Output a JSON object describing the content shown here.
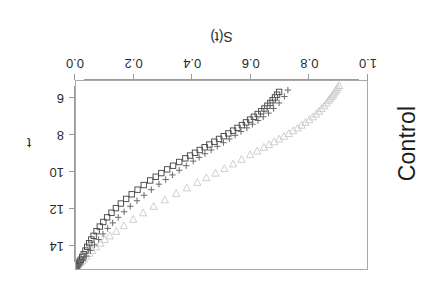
{
  "figure": {
    "title": "Control",
    "rotation_degrees": 180,
    "background": "#ffffff",
    "frame_color": "#a8a8a8"
  },
  "axes": {
    "x": {
      "label": "t",
      "ticks": [
        "6",
        "8",
        "10",
        "12",
        "14"
      ],
      "tick_values": [
        6,
        8,
        10,
        12,
        14
      ],
      "range": [
        5.0,
        15.3
      ]
    },
    "y": {
      "label": "S(t)",
      "ticks": [
        "1.0",
        "0.8",
        "0.6",
        "0.4",
        "0.2",
        "0.0"
      ],
      "tick_values": [
        1.0,
        0.8,
        0.6,
        0.4,
        0.2,
        0.0
      ],
      "range": [
        0.0,
        1.0
      ]
    }
  },
  "legend": {
    "visible": false,
    "entries": [
      {
        "name": "triangle-series",
        "symbol": "triangle-down",
        "color": "#c9c9c9"
      },
      {
        "name": "square-series",
        "symbol": "square-open",
        "color": "#4a4a4a"
      },
      {
        "name": "plus-series",
        "symbol": "plus",
        "color": "#6a6a6a"
      }
    ]
  },
  "chart_data": {
    "type": "scatter",
    "title": "Control",
    "xlabel": "t",
    "ylabel": "S(t)",
    "xlim": [
      5.0,
      15.3
    ],
    "ylim": [
      0.0,
      1.0
    ],
    "grid": false,
    "legend_position": "none",
    "series": [
      {
        "name": "triangle-down",
        "marker": "triangle-down",
        "color": "#c9c9c9",
        "points": [
          [
            5.35,
            0.905
          ],
          [
            5.45,
            0.9
          ],
          [
            5.55,
            0.896
          ],
          [
            5.65,
            0.892
          ],
          [
            5.75,
            0.888
          ],
          [
            5.85,
            0.884
          ],
          [
            5.95,
            0.879
          ],
          [
            6.05,
            0.874
          ],
          [
            6.15,
            0.869
          ],
          [
            6.3,
            0.862
          ],
          [
            6.45,
            0.854
          ],
          [
            6.6,
            0.845
          ],
          [
            6.75,
            0.836
          ],
          [
            6.9,
            0.826
          ],
          [
            7.05,
            0.815
          ],
          [
            7.2,
            0.803
          ],
          [
            7.35,
            0.79
          ],
          [
            7.5,
            0.777
          ],
          [
            7.65,
            0.763
          ],
          [
            7.8,
            0.748
          ],
          [
            7.95,
            0.733
          ],
          [
            8.1,
            0.717
          ],
          [
            8.25,
            0.7
          ],
          [
            8.4,
            0.683
          ],
          [
            8.55,
            0.666
          ],
          [
            8.7,
            0.648
          ],
          [
            8.9,
            0.625
          ],
          [
            9.1,
            0.601
          ],
          [
            9.35,
            0.572
          ],
          [
            9.6,
            0.543
          ],
          [
            9.85,
            0.513
          ],
          [
            10.1,
            0.483
          ],
          [
            10.35,
            0.452
          ],
          [
            10.6,
            0.421
          ],
          [
            10.9,
            0.385
          ],
          [
            11.2,
            0.349
          ],
          [
            11.55,
            0.31
          ],
          [
            11.9,
            0.272
          ],
          [
            12.25,
            0.236
          ],
          [
            12.6,
            0.202
          ],
          [
            12.95,
            0.17
          ],
          [
            13.25,
            0.144
          ],
          [
            13.5,
            0.122
          ],
          [
            13.7,
            0.105
          ],
          [
            13.9,
            0.09
          ],
          [
            14.1,
            0.075
          ],
          [
            14.3,
            0.062
          ],
          [
            14.45,
            0.052
          ],
          [
            14.6,
            0.043
          ],
          [
            14.75,
            0.034
          ],
          [
            14.85,
            0.028
          ],
          [
            14.95,
            0.022
          ],
          [
            15.05,
            0.016
          ],
          [
            15.12,
            0.011
          ],
          [
            15.18,
            0.007
          ]
        ]
      },
      {
        "name": "square-open",
        "marker": "square-open",
        "color": "#4a4a4a",
        "points": [
          [
            5.7,
            0.7
          ],
          [
            5.85,
            0.693
          ],
          [
            6.0,
            0.686
          ],
          [
            6.15,
            0.678
          ],
          [
            6.3,
            0.67
          ],
          [
            6.45,
            0.66
          ],
          [
            6.6,
            0.65
          ],
          [
            6.75,
            0.639
          ],
          [
            6.9,
            0.627
          ],
          [
            7.05,
            0.614
          ],
          [
            7.2,
            0.601
          ],
          [
            7.35,
            0.587
          ],
          [
            7.5,
            0.573
          ],
          [
            7.65,
            0.558
          ],
          [
            7.8,
            0.543
          ],
          [
            7.95,
            0.527
          ],
          [
            8.1,
            0.511
          ],
          [
            8.25,
            0.495
          ],
          [
            8.4,
            0.479
          ],
          [
            8.55,
            0.462
          ],
          [
            8.7,
            0.446
          ],
          [
            8.85,
            0.429
          ],
          [
            9.0,
            0.413
          ],
          [
            9.15,
            0.396
          ],
          [
            9.3,
            0.38
          ],
          [
            9.5,
            0.359
          ],
          [
            9.7,
            0.338
          ],
          [
            9.9,
            0.318
          ],
          [
            10.1,
            0.298
          ],
          [
            10.3,
            0.279
          ],
          [
            10.5,
            0.26
          ],
          [
            10.75,
            0.238
          ],
          [
            11.0,
            0.217
          ],
          [
            11.25,
            0.197
          ],
          [
            11.5,
            0.178
          ],
          [
            11.75,
            0.16
          ],
          [
            12.0,
            0.143
          ],
          [
            12.25,
            0.128
          ],
          [
            12.5,
            0.113
          ],
          [
            12.75,
            0.1
          ],
          [
            13.0,
            0.088
          ],
          [
            13.25,
            0.077
          ],
          [
            13.5,
            0.067
          ],
          [
            13.7,
            0.059
          ],
          [
            13.9,
            0.052
          ],
          [
            14.1,
            0.045
          ],
          [
            14.3,
            0.039
          ],
          [
            14.5,
            0.033
          ],
          [
            14.65,
            0.028
          ],
          [
            14.8,
            0.023
          ],
          [
            14.9,
            0.019
          ],
          [
            15.0,
            0.015
          ],
          [
            15.08,
            0.011
          ],
          [
            15.15,
            0.008
          ],
          [
            15.22,
            0.005
          ]
        ]
      },
      {
        "name": "plus",
        "marker": "plus",
        "color": "#6a6a6a",
        "points": [
          [
            5.6,
            0.73
          ],
          [
            5.95,
            0.718
          ],
          [
            6.3,
            0.7
          ],
          [
            6.6,
            0.681
          ],
          [
            6.85,
            0.664
          ],
          [
            7.05,
            0.646
          ],
          [
            7.25,
            0.628
          ],
          [
            7.45,
            0.609
          ],
          [
            7.65,
            0.59
          ],
          [
            7.85,
            0.57
          ],
          [
            8.05,
            0.55
          ],
          [
            8.25,
            0.53
          ],
          [
            8.45,
            0.51
          ],
          [
            8.65,
            0.489
          ],
          [
            8.85,
            0.468
          ],
          [
            9.05,
            0.447
          ],
          [
            9.25,
            0.427
          ],
          [
            9.45,
            0.407
          ],
          [
            9.7,
            0.383
          ],
          [
            9.95,
            0.359
          ],
          [
            10.2,
            0.336
          ],
          [
            10.45,
            0.313
          ],
          [
            10.7,
            0.29
          ],
          [
            11.0,
            0.264
          ],
          [
            11.3,
            0.239
          ],
          [
            11.6,
            0.215
          ],
          [
            11.9,
            0.192
          ],
          [
            12.2,
            0.171
          ],
          [
            12.5,
            0.151
          ],
          [
            12.8,
            0.132
          ],
          [
            13.1,
            0.115
          ],
          [
            13.4,
            0.099
          ],
          [
            13.7,
            0.084
          ],
          [
            14.0,
            0.07
          ],
          [
            14.3,
            0.056
          ],
          [
            14.6,
            0.042
          ],
          [
            14.85,
            0.03
          ],
          [
            15.05,
            0.018
          ],
          [
            15.2,
            0.009
          ]
        ]
      }
    ]
  }
}
